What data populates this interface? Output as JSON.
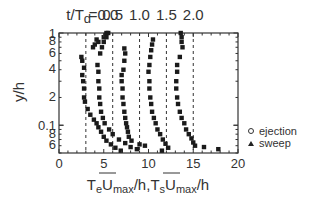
{
  "chart_data": {
    "type": "scatter",
    "title": "",
    "xlabel": "T̄eUmax/h, T̄sUmax/h",
    "xlabel_parts": [
      "T",
      "e",
      "U",
      "max",
      "/h,",
      "T",
      "s",
      "U",
      "max",
      "/h"
    ],
    "ylabel": "y/h",
    "xlim": [
      0,
      20
    ],
    "ylim": [
      0.05,
      1
    ],
    "yscale": "log",
    "x_ticks": [
      0,
      5,
      10,
      15,
      20
    ],
    "x_tick_labels": [
      "0",
      "5",
      "10",
      "15",
      "20"
    ],
    "y_ticks": [
      1,
      0.8,
      0.6,
      0.4,
      0.2,
      0.1,
      0.08,
      0.06
    ],
    "y_tick_labels": [
      "1",
      "8",
      "6",
      "4",
      "2",
      "0.1",
      "8",
      "6"
    ],
    "grid": false,
    "top_annotation_prefix": "t/T",
    "top_annotation_sub": "d",
    "top_annotations": [
      {
        "label": "=0.0",
        "x": 3
      },
      {
        "label": "0.5",
        "x": 6
      },
      {
        "label": "1.0",
        "x": 9
      },
      {
        "label": "1.5",
        "x": 12
      },
      {
        "label": "2.0",
        "x": 15
      }
    ],
    "reference_lines": [
      3,
      6,
      9,
      12,
      15
    ],
    "legend": {
      "position": "right",
      "entries": [
        {
          "marker": "open-circle",
          "label": "ejection"
        },
        {
          "marker": "filled-triangle",
          "label": "sweep"
        }
      ]
    },
    "series": [
      {
        "name": "profile t/Td=0.0",
        "points": [
          [
            5.3,
            1.0
          ],
          [
            5.2,
            0.95
          ],
          [
            5.0,
            0.9
          ],
          [
            4.2,
            0.85
          ],
          [
            4.4,
            0.8
          ],
          [
            4.0,
            0.75
          ],
          [
            3.8,
            0.7
          ],
          [
            2.5,
            0.55
          ],
          [
            2.6,
            0.5
          ],
          [
            2.8,
            0.42
          ],
          [
            2.6,
            0.35
          ],
          [
            2.7,
            0.3
          ],
          [
            2.8,
            0.25
          ],
          [
            2.8,
            0.2
          ],
          [
            2.9,
            0.18
          ],
          [
            3.2,
            0.15
          ],
          [
            3.5,
            0.13
          ],
          [
            3.9,
            0.115
          ],
          [
            4.2,
            0.105
          ],
          [
            4.4,
            0.095
          ],
          [
            4.7,
            0.085
          ],
          [
            5.0,
            0.075
          ],
          [
            5.3,
            0.068
          ],
          [
            5.8,
            0.062
          ],
          [
            6.3,
            0.057
          ],
          [
            6.9,
            0.053
          ]
        ]
      },
      {
        "name": "profile t/Td=0.5",
        "points": [
          [
            5.5,
            1.0
          ],
          [
            5.3,
            0.9
          ],
          [
            5.0,
            0.8
          ],
          [
            4.8,
            0.7
          ],
          [
            4.6,
            0.6
          ],
          [
            4.3,
            0.45
          ],
          [
            4.4,
            0.38
          ],
          [
            4.4,
            0.3
          ],
          [
            4.5,
            0.25
          ],
          [
            4.5,
            0.2
          ],
          [
            4.6,
            0.17
          ],
          [
            4.7,
            0.14
          ],
          [
            4.9,
            0.12
          ],
          [
            5.1,
            0.105
          ],
          [
            5.6,
            0.09
          ],
          [
            6.0,
            0.08
          ],
          [
            6.7,
            0.07
          ],
          [
            7.4,
            0.064
          ],
          [
            8.0,
            0.058
          ],
          [
            8.7,
            0.055
          ]
        ]
      },
      {
        "name": "profile t/Td=1.0",
        "points": [
          [
            7.3,
            0.68
          ],
          [
            7.4,
            0.6
          ],
          [
            7.3,
            0.5
          ],
          [
            7.2,
            0.4
          ],
          [
            7.0,
            0.35
          ],
          [
            7.0,
            0.3
          ],
          [
            7.1,
            0.25
          ],
          [
            7.1,
            0.2
          ],
          [
            7.2,
            0.17
          ],
          [
            7.3,
            0.14
          ],
          [
            7.4,
            0.12
          ],
          [
            7.5,
            0.105
          ],
          [
            7.6,
            0.095
          ],
          [
            7.7,
            0.085
          ],
          [
            7.8,
            0.075
          ],
          [
            8.1,
            0.068
          ],
          [
            9.0,
            0.062
          ],
          [
            9.6,
            0.06
          ],
          [
            11.5,
            0.053
          ]
        ]
      },
      {
        "name": "profile t/Td=1.5",
        "points": [
          [
            10.5,
            0.85
          ],
          [
            10.4,
            0.75
          ],
          [
            10.3,
            0.65
          ],
          [
            10.2,
            0.55
          ],
          [
            10.1,
            0.45
          ],
          [
            10.0,
            0.38
          ],
          [
            10.1,
            0.3
          ],
          [
            10.1,
            0.25
          ],
          [
            10.2,
            0.2
          ],
          [
            10.3,
            0.17
          ],
          [
            10.4,
            0.14
          ],
          [
            10.6,
            0.12
          ],
          [
            10.8,
            0.105
          ],
          [
            11.0,
            0.09
          ],
          [
            11.3,
            0.08
          ],
          [
            11.6,
            0.07
          ],
          [
            11.9,
            0.063
          ],
          [
            12.2,
            0.057
          ]
        ]
      },
      {
        "name": "profile t/Td=2.0",
        "points": [
          [
            13.6,
            1.0
          ],
          [
            13.7,
            0.9
          ],
          [
            13.7,
            0.8
          ],
          [
            13.8,
            0.7
          ],
          [
            13.5,
            0.55
          ],
          [
            13.2,
            0.45
          ],
          [
            13.2,
            0.38
          ],
          [
            13.1,
            0.3
          ],
          [
            13.1,
            0.25
          ],
          [
            13.2,
            0.2
          ],
          [
            13.3,
            0.17
          ],
          [
            13.5,
            0.14
          ],
          [
            13.7,
            0.12
          ],
          [
            14.0,
            0.105
          ],
          [
            14.2,
            0.09
          ],
          [
            14.5,
            0.08
          ],
          [
            14.8,
            0.072
          ],
          [
            15.0,
            0.065
          ],
          [
            15.2,
            0.06
          ],
          [
            16.2,
            0.058
          ],
          [
            17.8,
            0.055
          ]
        ]
      }
    ]
  }
}
